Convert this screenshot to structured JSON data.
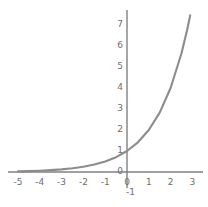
{
  "chart_data": {
    "type": "line",
    "title": "",
    "subtitle": "",
    "xlabel": "",
    "ylabel": "",
    "xlim": [
      -5,
      3
    ],
    "ylim": [
      -1,
      7
    ],
    "grid": false,
    "legend": null,
    "axis_color": "#808080",
    "curve_color": "#8c8c8c",
    "tick_label_color": "#6e6e6e",
    "background_color": "#ffffff",
    "x_ticks": [
      "-5",
      "-4",
      "-3",
      "-2",
      "-1",
      "0",
      "1",
      "2",
      "3"
    ],
    "x_tick_values": [
      -5,
      -4,
      -3,
      -2,
      -1,
      0,
      1,
      2,
      3
    ],
    "y_ticks": [
      "7",
      "6",
      "5",
      "4",
      "3",
      "2",
      "1",
      "0",
      "-1"
    ],
    "y_tick_values": [
      7,
      6,
      5,
      4,
      3,
      2,
      1,
      0,
      -1
    ],
    "series": [
      {
        "name": "y = 2^x",
        "x": [
          -5,
          -4.5,
          -4,
          -3.5,
          -3,
          -2.5,
          -2,
          -1.5,
          -1,
          -0.5,
          0,
          0.5,
          1,
          1.5,
          2,
          2.5,
          2.75,
          2.9
        ],
        "values": [
          0.031,
          0.044,
          0.063,
          0.088,
          0.125,
          0.177,
          0.25,
          0.354,
          0.5,
          0.707,
          1,
          1.414,
          2,
          2.828,
          4,
          5.657,
          6.727,
          7.464
        ]
      }
    ],
    "annotations": []
  }
}
